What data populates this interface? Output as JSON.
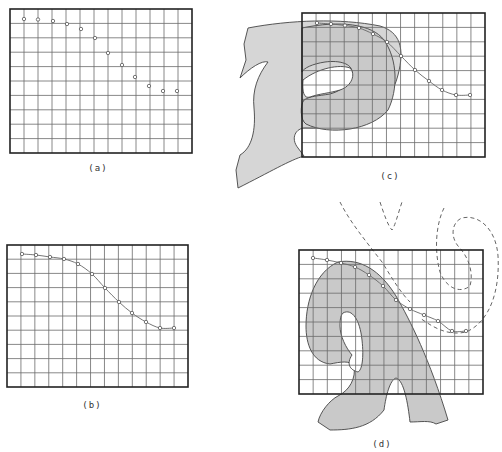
{
  "figure": {
    "panels": [
      {
        "id": "a",
        "label": "(a)",
        "label_pos": [
          98,
          171
        ],
        "frame": {
          "x": 10,
          "y": 9,
          "w": 182,
          "h": 144
        },
        "cols": 13,
        "rows": 10,
        "points": [
          [
            24,
            19
          ],
          [
            38,
            19.5
          ],
          [
            53,
            21
          ],
          [
            67,
            24
          ],
          [
            81,
            29
          ],
          [
            95,
            38
          ],
          [
            108,
            53
          ],
          [
            122,
            65
          ],
          [
            135,
            77
          ],
          [
            149,
            86
          ],
          [
            163,
            91
          ],
          [
            177,
            91
          ]
        ],
        "show_curve": false
      },
      {
        "id": "b",
        "label": "(b)",
        "label_pos": [
          92,
          408
        ],
        "frame": {
          "x": 7,
          "y": 245,
          "w": 181,
          "h": 142
        },
        "cols": 13,
        "rows": 10,
        "points": [
          [
            22,
            254
          ],
          [
            36,
            255
          ],
          [
            50,
            257
          ],
          [
            64,
            259
          ],
          [
            78,
            264
          ],
          [
            92,
            274
          ],
          [
            105,
            288
          ],
          [
            119,
            302
          ],
          [
            132,
            313
          ],
          [
            146,
            322
          ],
          [
            160,
            328
          ],
          [
            174,
            328
          ]
        ],
        "show_curve": true
      },
      {
        "id": "c",
        "label": "(c)",
        "label_pos": [
          390,
          179
        ],
        "frame": {
          "x": 302,
          "y": 13,
          "w": 183,
          "h": 144
        },
        "cols": 13,
        "rows": 10,
        "points": [
          [
            317,
            23
          ],
          [
            331,
            24
          ],
          [
            345,
            25.5
          ],
          [
            359,
            28
          ],
          [
            373,
            34
          ],
          [
            387,
            42
          ],
          [
            401,
            56
          ],
          [
            415,
            70
          ],
          [
            429,
            81
          ],
          [
            442,
            90
          ],
          [
            456,
            95
          ],
          [
            470,
            95
          ]
        ],
        "show_curve": true
      },
      {
        "id": "d",
        "label": "(d)",
        "label_pos": [
          382,
          447
        ],
        "frame": {
          "x": 299,
          "y": 250,
          "w": 184,
          "h": 144
        },
        "cols": 13,
        "rows": 10,
        "points": [
          [
            313,
            258
          ],
          [
            327,
            260
          ],
          [
            341,
            263
          ],
          [
            355,
            267
          ],
          [
            369,
            275
          ],
          [
            383,
            286
          ],
          [
            396,
            300
          ],
          [
            410,
            309
          ],
          [
            424,
            315
          ],
          [
            438,
            321
          ],
          [
            452,
            331
          ],
          [
            466,
            331
          ]
        ],
        "show_curve": true
      }
    ]
  }
}
